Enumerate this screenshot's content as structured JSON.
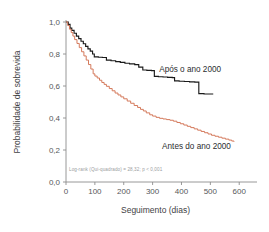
{
  "chart_data": {
    "type": "line",
    "subtype": "kaplan-meier-survival",
    "title": "",
    "xlabel": "Seguimento (dias)",
    "ylabel": "Probabilidade de sobrevida",
    "xlim": [
      0,
      620
    ],
    "ylim": [
      0.0,
      1.0
    ],
    "xticks": [
      0,
      100,
      200,
      300,
      400,
      500,
      600
    ],
    "xtick_labels": [
      "0",
      "100",
      "200",
      "300",
      "400",
      "500",
      "600"
    ],
    "yticks": [
      0.0,
      0.2,
      0.4,
      0.6,
      0.8,
      1.0
    ],
    "ytick_labels": [
      "0,0",
      "0,2",
      "0,4",
      "0,6",
      "0,8",
      "1,0"
    ],
    "grid": false,
    "legend_position": "inline-annotation",
    "annotation": "Log-rank (Qui-quadrado) = 28,32; p < 0,001",
    "series": [
      {
        "name": "Após o ano 2000",
        "color": "#1a1a1a",
        "label_x": 430,
        "label_y": 0.685,
        "points": [
          [
            0,
            1.0
          ],
          [
            8,
            0.985
          ],
          [
            14,
            0.962
          ],
          [
            20,
            0.948
          ],
          [
            28,
            0.93
          ],
          [
            36,
            0.912
          ],
          [
            44,
            0.896
          ],
          [
            52,
            0.88
          ],
          [
            60,
            0.864
          ],
          [
            68,
            0.848
          ],
          [
            76,
            0.832
          ],
          [
            84,
            0.818
          ],
          [
            92,
            0.8
          ],
          [
            98,
            0.782
          ],
          [
            112,
            0.78
          ],
          [
            126,
            0.778
          ],
          [
            140,
            0.762
          ],
          [
            156,
            0.758
          ],
          [
            172,
            0.752
          ],
          [
            188,
            0.748
          ],
          [
            204,
            0.742
          ],
          [
            220,
            0.738
          ],
          [
            238,
            0.734
          ],
          [
            252,
            0.718
          ],
          [
            266,
            0.7
          ],
          [
            280,
            0.698
          ],
          [
            296,
            0.696
          ],
          [
            306,
            0.66
          ],
          [
            320,
            0.658
          ],
          [
            336,
            0.656
          ],
          [
            352,
            0.654
          ],
          [
            368,
            0.652
          ],
          [
            376,
            0.632
          ],
          [
            392,
            0.63
          ],
          [
            410,
            0.628
          ],
          [
            428,
            0.626
          ],
          [
            446,
            0.624
          ],
          [
            460,
            0.552
          ],
          [
            478,
            0.55
          ],
          [
            496,
            0.55
          ],
          [
            510,
            0.55
          ]
        ]
      },
      {
        "name": "Antes do ano 2000",
        "color": "#d4795b",
        "label_x": 452,
        "label_y": 0.205,
        "points": [
          [
            0,
            1.0
          ],
          [
            6,
            0.978
          ],
          [
            12,
            0.955
          ],
          [
            18,
            0.934
          ],
          [
            24,
            0.912
          ],
          [
            30,
            0.89
          ],
          [
            38,
            0.866
          ],
          [
            46,
            0.84
          ],
          [
            54,
            0.814
          ],
          [
            62,
            0.788
          ],
          [
            70,
            0.762
          ],
          [
            78,
            0.734
          ],
          [
            86,
            0.706
          ],
          [
            94,
            0.676
          ],
          [
            100,
            0.662
          ],
          [
            108,
            0.65
          ],
          [
            116,
            0.636
          ],
          [
            124,
            0.622
          ],
          [
            132,
            0.61
          ],
          [
            140,
            0.598
          ],
          [
            150,
            0.584
          ],
          [
            160,
            0.57
          ],
          [
            170,
            0.556
          ],
          [
            180,
            0.544
          ],
          [
            190,
            0.532
          ],
          [
            200,
            0.52
          ],
          [
            212,
            0.506
          ],
          [
            224,
            0.492
          ],
          [
            236,
            0.478
          ],
          [
            248,
            0.466
          ],
          [
            258,
            0.454
          ],
          [
            268,
            0.444
          ],
          [
            278,
            0.432
          ],
          [
            290,
            0.42
          ],
          [
            300,
            0.412
          ],
          [
            312,
            0.404
          ],
          [
            324,
            0.398
          ],
          [
            336,
            0.394
          ],
          [
            348,
            0.39
          ],
          [
            360,
            0.386
          ],
          [
            372,
            0.38
          ],
          [
            384,
            0.372
          ],
          [
            396,
            0.364
          ],
          [
            408,
            0.356
          ],
          [
            420,
            0.348
          ],
          [
            432,
            0.34
          ],
          [
            444,
            0.332
          ],
          [
            456,
            0.324
          ],
          [
            468,
            0.316
          ],
          [
            480,
            0.308
          ],
          [
            492,
            0.3
          ],
          [
            504,
            0.292
          ],
          [
            516,
            0.286
          ],
          [
            528,
            0.28
          ],
          [
            540,
            0.274
          ],
          [
            552,
            0.268
          ],
          [
            564,
            0.262
          ],
          [
            574,
            0.256
          ],
          [
            582,
            0.252
          ]
        ]
      }
    ]
  }
}
